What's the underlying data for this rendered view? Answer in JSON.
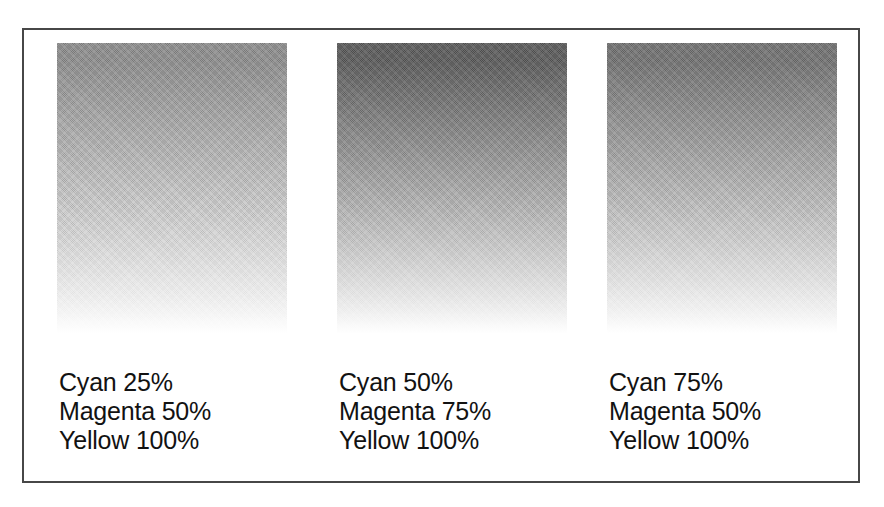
{
  "figure": {
    "type": "cmyk-gradient-swatch-chart",
    "background_color": "#ffffff",
    "frame_border_color": "#474747",
    "text_color": "#121212",
    "swatches": [
      {
        "id": "swatch-1",
        "top_color": "#8b8b8b",
        "bottom_color": "#ffffff",
        "caption_lines": [
          "Cyan 25%",
          "Magenta 50%",
          "Yellow 100%"
        ],
        "inks": {
          "cyan": "25%",
          "magenta": "50%",
          "yellow": "100%"
        }
      },
      {
        "id": "swatch-2",
        "top_color": "#585858",
        "bottom_color": "#ffffff",
        "caption_lines": [
          "Cyan 50%",
          "Magenta 75%",
          "Yellow 100%"
        ],
        "inks": {
          "cyan": "50%",
          "magenta": "75%",
          "yellow": "100%"
        }
      },
      {
        "id": "swatch-3",
        "top_color": "#6f6f6f",
        "bottom_color": "#ffffff",
        "caption_lines": [
          "Cyan 75%",
          "Magenta 50%",
          "Yellow 100%"
        ],
        "inks": {
          "cyan": "75%",
          "magenta": "50%",
          "yellow": "100%"
        }
      }
    ]
  },
  "chart_data": {
    "type": "heatmap",
    "title": "",
    "xlabel": "",
    "ylabel": "",
    "categories": [
      "Cyan 25% / Magenta 50% / Yellow 100%",
      "Cyan 50% / Magenta 75% / Yellow 100%",
      "Cyan 75% / Magenta 50% / Yellow 100%"
    ],
    "series": [
      {
        "name": "Top tint density (gray level 0-255)",
        "values": [
          139,
          88,
          111
        ]
      },
      {
        "name": "Bottom tint density (gray level 0-255)",
        "values": [
          255,
          255,
          255
        ]
      },
      {
        "name": "Cyan %",
        "values": [
          25,
          50,
          75
        ]
      },
      {
        "name": "Magenta %",
        "values": [
          50,
          75,
          50
        ]
      },
      {
        "name": "Yellow %",
        "values": [
          100,
          100,
          100
        ]
      }
    ],
    "legend_position": "none",
    "grid": false
  }
}
